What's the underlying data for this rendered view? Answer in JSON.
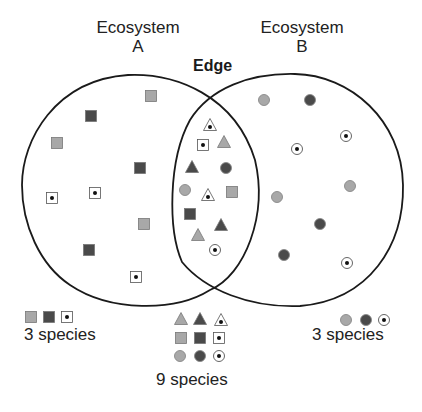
{
  "labels": {
    "ecosystem_a": "Ecosystem\nA",
    "ecosystem_a_line1": "Ecosystem",
    "ecosystem_a_line2": "A",
    "ecosystem_b_line1": "Ecosystem",
    "ecosystem_b_line2": "B",
    "edge": "Edge"
  },
  "counts": {
    "a": "3 species",
    "edge": "9 species",
    "b": "3 species"
  },
  "colors": {
    "outline": "#1a1a1a",
    "light_fill": "#a8a8a8",
    "dark_fill": "#4a4a4a"
  },
  "regions": {
    "ecosystem_a": {
      "species": [
        "light-square",
        "dark-square",
        "dotted-square"
      ],
      "symbols": [
        {
          "shape": "square",
          "style": "light",
          "x": 151,
          "y": 96
        },
        {
          "shape": "square",
          "style": "dark",
          "x": 91,
          "y": 116
        },
        {
          "shape": "square",
          "style": "light",
          "x": 57,
          "y": 143
        },
        {
          "shape": "square",
          "style": "dark",
          "x": 140,
          "y": 168
        },
        {
          "shape": "square",
          "style": "dot",
          "x": 52,
          "y": 198
        },
        {
          "shape": "square",
          "style": "dot",
          "x": 95,
          "y": 193
        },
        {
          "shape": "square",
          "style": "light",
          "x": 144,
          "y": 224
        },
        {
          "shape": "square",
          "style": "dark",
          "x": 89,
          "y": 250
        },
        {
          "shape": "square",
          "style": "dot",
          "x": 136,
          "y": 277
        }
      ]
    },
    "edge": {
      "species": [
        "light-triangle",
        "dark-triangle",
        "dotted-triangle",
        "light-square",
        "dark-square",
        "dotted-square",
        "light-circle",
        "dark-circle",
        "dotted-circle"
      ],
      "symbols": [
        {
          "shape": "triangle",
          "style": "dot",
          "x": 210,
          "y": 125
        },
        {
          "shape": "square",
          "style": "dot",
          "x": 203,
          "y": 145
        },
        {
          "shape": "triangle",
          "style": "light",
          "x": 224,
          "y": 142
        },
        {
          "shape": "triangle",
          "style": "dark",
          "x": 192,
          "y": 167
        },
        {
          "shape": "circle",
          "style": "dark",
          "x": 226,
          "y": 168
        },
        {
          "shape": "circle",
          "style": "light",
          "x": 185,
          "y": 190
        },
        {
          "shape": "triangle",
          "style": "dot",
          "x": 208,
          "y": 195
        },
        {
          "shape": "square",
          "style": "light",
          "x": 232,
          "y": 192
        },
        {
          "shape": "square",
          "style": "dark",
          "x": 190,
          "y": 214
        },
        {
          "shape": "triangle",
          "style": "dark",
          "x": 221,
          "y": 225
        },
        {
          "shape": "triangle",
          "style": "light",
          "x": 198,
          "y": 235
        },
        {
          "shape": "circle",
          "style": "dot",
          "x": 215,
          "y": 250
        }
      ]
    },
    "ecosystem_b": {
      "species": [
        "light-circle",
        "dark-circle",
        "dotted-circle"
      ],
      "symbols": [
        {
          "shape": "circle",
          "style": "light",
          "x": 264,
          "y": 100
        },
        {
          "shape": "circle",
          "style": "dark",
          "x": 310,
          "y": 100
        },
        {
          "shape": "circle",
          "style": "dot",
          "x": 346,
          "y": 136
        },
        {
          "shape": "circle",
          "style": "dot",
          "x": 297,
          "y": 149
        },
        {
          "shape": "circle",
          "style": "light",
          "x": 350,
          "y": 186
        },
        {
          "shape": "circle",
          "style": "light",
          "x": 277,
          "y": 197
        },
        {
          "shape": "circle",
          "style": "dark",
          "x": 320,
          "y": 224
        },
        {
          "shape": "circle",
          "style": "dark",
          "x": 284,
          "y": 255
        },
        {
          "shape": "circle",
          "style": "dot",
          "x": 347,
          "y": 263
        }
      ]
    }
  },
  "legend": {
    "a": [
      {
        "shape": "square",
        "style": "light",
        "x": 31,
        "y": 317
      },
      {
        "shape": "square",
        "style": "dark",
        "x": 49,
        "y": 317
      },
      {
        "shape": "square",
        "style": "dot",
        "x": 67,
        "y": 317
      }
    ],
    "edge": [
      {
        "shape": "triangle",
        "style": "light",
        "x": 181,
        "y": 319
      },
      {
        "shape": "triangle",
        "style": "dark",
        "x": 200,
        "y": 319
      },
      {
        "shape": "triangle",
        "style": "dot",
        "x": 221,
        "y": 320
      },
      {
        "shape": "square",
        "style": "light",
        "x": 181,
        "y": 338
      },
      {
        "shape": "square",
        "style": "dark",
        "x": 200,
        "y": 338
      },
      {
        "shape": "square",
        "style": "dot",
        "x": 219,
        "y": 338
      },
      {
        "shape": "circle",
        "style": "light",
        "x": 180,
        "y": 356
      },
      {
        "shape": "circle",
        "style": "dark",
        "x": 200,
        "y": 356
      },
      {
        "shape": "circle",
        "style": "dot",
        "x": 219,
        "y": 356
      }
    ],
    "b": [
      {
        "shape": "circle",
        "style": "light",
        "x": 346,
        "y": 320
      },
      {
        "shape": "circle",
        "style": "dark",
        "x": 366,
        "y": 320
      },
      {
        "shape": "circle",
        "style": "dot",
        "x": 384,
        "y": 320
      }
    ]
  }
}
